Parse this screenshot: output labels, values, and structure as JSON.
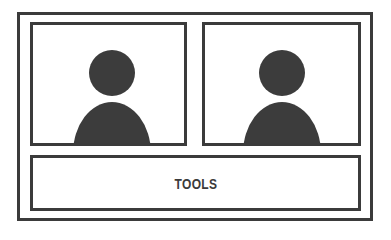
{
  "layout": {
    "participants": [
      {
        "name": "participant-1",
        "icon": "person-icon"
      },
      {
        "name": "participant-2",
        "icon": "person-icon"
      }
    ],
    "toolbar": {
      "label": "TOOLS"
    }
  },
  "colors": {
    "stroke": "#3b3b3b",
    "fill": "#3c3c3c",
    "background": "#ffffff"
  }
}
